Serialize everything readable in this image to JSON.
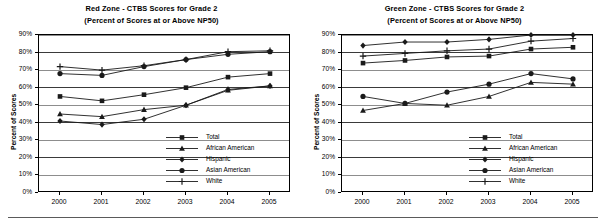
{
  "figure": {
    "panels": [
      "red",
      "green"
    ],
    "axis_label": "Percent of Scores",
    "y_ticks": [
      "0%",
      "10%",
      "20%",
      "30%",
      "40%",
      "50%",
      "60%",
      "70%",
      "80%",
      "90%"
    ],
    "x_ticks": [
      "2000",
      "2001",
      "2002",
      "2003",
      "2004",
      "2005"
    ],
    "legend_labels": [
      "Total",
      "African American",
      "Hispanic",
      "Asian American",
      "White"
    ],
    "marker_names": [
      "square-marker",
      "triangle-marker",
      "diamond-marker",
      "circle-marker",
      "plus-marker"
    ],
    "line_color": "#1a1a1a",
    "grid_color": "#8d8d8d"
  },
  "chart_data": [
    {
      "type": "line",
      "title": "Red Zone - CTBS Scores for Grade 2",
      "subtitle": "(Percent of Scores at or Above NP50)",
      "xlabel": "",
      "ylabel": "Percent of Scores",
      "categories": [
        "2000",
        "2001",
        "2002",
        "2003",
        "2004",
        "2005"
      ],
      "ylim": [
        0,
        90
      ],
      "ytick_step": 10,
      "grid": true,
      "legend_position": "inside-lower-right",
      "series": [
        {
          "name": "Total",
          "marker": "square",
          "values": [
            55,
            52.5,
            56,
            60,
            66,
            68
          ]
        },
        {
          "name": "African American",
          "marker": "triangle",
          "values": [
            45,
            43.5,
            47.5,
            50,
            58.5,
            61
          ]
        },
        {
          "name": "Hispanic",
          "marker": "diamond",
          "values": [
            41,
            39,
            42,
            50,
            59,
            61
          ]
        },
        {
          "name": "Asian American",
          "marker": "circle",
          "values": [
            68,
            67,
            72,
            76,
            79,
            80.5
          ]
        },
        {
          "name": "White",
          "marker": "plus",
          "values": [
            72,
            70,
            72.5,
            76,
            80.5,
            81
          ]
        }
      ]
    },
    {
      "type": "line",
      "title": "Green Zone - CTBS Scores for Grade 2",
      "subtitle": "(Percent of Scores at or Above NP50)",
      "xlabel": "",
      "ylabel": "Percent of Scores",
      "categories": [
        "2000",
        "2001",
        "2002",
        "2003",
        "2004",
        "2005"
      ],
      "ylim": [
        0,
        90
      ],
      "ytick_step": 10,
      "grid": true,
      "legend_position": "inside-lower-right",
      "series": [
        {
          "name": "Total",
          "marker": "square",
          "values": [
            74,
            75.5,
            77.5,
            78,
            82,
            83
          ]
        },
        {
          "name": "African American",
          "marker": "triangle",
          "values": [
            47,
            51,
            50,
            55,
            63,
            62
          ]
        },
        {
          "name": "Hispanic",
          "marker": "diamond",
          "values": [
            84,
            86,
            86,
            87.5,
            90,
            90
          ]
        },
        {
          "name": "Asian American",
          "marker": "circle",
          "values": [
            55,
            51,
            57.5,
            62,
            68,
            65
          ]
        },
        {
          "name": "White",
          "marker": "plus",
          "values": [
            78,
            79.5,
            81,
            82,
            86.5,
            88
          ]
        }
      ]
    }
  ]
}
